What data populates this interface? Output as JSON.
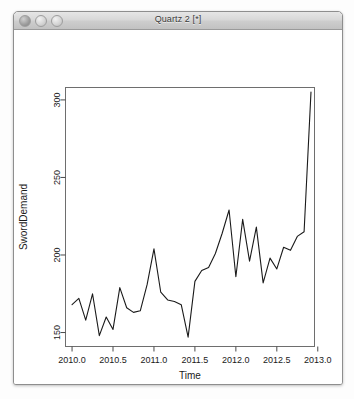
{
  "window": {
    "title": "Quartz 2 [*]",
    "controls": [
      {
        "name": "close",
        "label": "Close"
      },
      {
        "name": "minimize",
        "label": "Minimize"
      },
      {
        "name": "zoom",
        "label": "Zoom"
      }
    ]
  },
  "chart_data": {
    "type": "line",
    "title": "",
    "xlabel": "Time",
    "ylabel": "SwordDemand",
    "xlim": [
      2009.92,
      2012.96
    ],
    "ylim": [
      141,
      308
    ],
    "xticks": [
      2010.0,
      2010.5,
      2011.0,
      2011.5,
      2012.0,
      2012.5,
      2013.0
    ],
    "xticklabels": [
      "2010.0",
      "2010.5",
      "2011.0",
      "2011.5",
      "2012.0",
      "2012.5",
      "2013.0"
    ],
    "yticks": [
      150,
      200,
      250,
      300
    ],
    "yticklabels": [
      "150",
      "200",
      "250",
      "300"
    ],
    "grid": false,
    "legend": false,
    "series": [
      {
        "name": "SwordDemand",
        "x": [
          2010.0,
          2010.083,
          2010.167,
          2010.25,
          2010.333,
          2010.417,
          2010.5,
          2010.583,
          2010.667,
          2010.75,
          2010.833,
          2010.917,
          2011.0,
          2011.083,
          2011.167,
          2011.25,
          2011.333,
          2011.417,
          2011.5,
          2011.583,
          2011.667,
          2011.75,
          2011.833,
          2011.917,
          2012.0,
          2012.083,
          2012.167,
          2012.25,
          2012.333,
          2012.417,
          2012.5,
          2012.583,
          2012.667,
          2012.75,
          2012.833,
          2012.917
        ],
        "y": [
          168,
          172,
          158,
          175,
          148,
          160,
          152,
          179,
          166,
          163,
          164,
          181,
          204,
          176,
          171,
          170,
          168,
          147,
          183,
          190,
          192,
          201,
          214,
          229,
          186,
          223,
          196,
          218,
          182,
          198,
          191,
          205,
          203,
          212,
          215,
          305
        ]
      }
    ]
  }
}
